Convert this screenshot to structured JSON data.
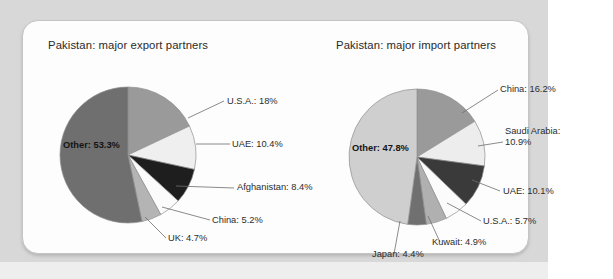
{
  "figure": {
    "background_color": "#d8d8d8",
    "card_color": "#fdfdfd"
  },
  "panels": [
    {
      "title": "Pakistan: major export partners"
    },
    {
      "title": "Pakistan: major import partners"
    }
  ],
  "labels": {
    "export": {
      "usa": "U.S.A.: 18%",
      "uae": "UAE: 10.4%",
      "afghanistan": "Afghanistan: 8.4%",
      "china": "China: 5.2%",
      "uk": "UK: 4.7%",
      "other": "Other: 53.3%"
    },
    "import": {
      "china": "China: 16.2%",
      "saudi": "Saudi Arabia: 10.9%",
      "uae": "UAE: 10.1%",
      "usa": "U.S.A.: 5.7%",
      "kuwait": "Kuwait: 4.9%",
      "japan": "Japan: 4.4%",
      "other": "Other: 47.8%"
    }
  },
  "chart_data": [
    {
      "type": "pie",
      "title": "Pakistan: major export partners",
      "categories": [
        "U.S.A.",
        "UAE",
        "Afghanistan",
        "China",
        "UK",
        "Other"
      ],
      "values": [
        18.0,
        10.4,
        8.4,
        5.2,
        4.7,
        53.3
      ],
      "unit": "percent",
      "start_angle_deg": 0,
      "direction": "clockwise",
      "colors": [
        "#9a9a9a",
        "#efefef",
        "#1e1e1e",
        "#fbfbfb",
        "#b4b4b4",
        "#6f6f6f"
      ],
      "legend": "labels-with-leader-lines",
      "labels": [
        "U.S.A.: 18%",
        "UAE: 10.4%",
        "Afghanistan: 8.4%",
        "China: 5.2%",
        "UK: 4.7%",
        "Other: 53.3%"
      ]
    },
    {
      "type": "pie",
      "title": "Pakistan: major import partners",
      "categories": [
        "China",
        "Saudi Arabia",
        "UAE",
        "U.S.A.",
        "Kuwait",
        "Japan",
        "Other"
      ],
      "values": [
        16.2,
        10.9,
        10.1,
        5.7,
        4.9,
        4.4,
        47.8
      ],
      "unit": "percent",
      "start_angle_deg": 0,
      "direction": "clockwise",
      "colors": [
        "#9a9a9a",
        "#ededed",
        "#3a3a3a",
        "#fbfbfb",
        "#b0b0b0",
        "#707070",
        "#cfcfcf"
      ],
      "legend": "labels-with-leader-lines",
      "labels": [
        "China: 16.2%",
        "Saudi Arabia: 10.9%",
        "UAE: 10.1%",
        "U.S.A.: 5.7%",
        "Kuwait: 4.9%",
        "Japan: 4.4%",
        "Other: 47.8%"
      ]
    }
  ]
}
